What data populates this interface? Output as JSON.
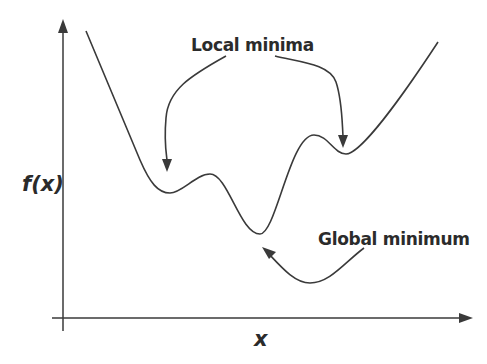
{
  "diagram": {
    "type": "function-landscape",
    "axes": {
      "y_label": "f(x)",
      "x_label": "x"
    },
    "annotations": {
      "local": "Local minima",
      "global": "Global minimum"
    },
    "colors": {
      "line": "#3a3a3a",
      "text": "#2b2b2b",
      "background": "#ffffff"
    },
    "curve_features": [
      {
        "kind": "start",
        "x": 86,
        "y": 31
      },
      {
        "kind": "local-minimum",
        "x": 170,
        "y": 193
      },
      {
        "kind": "local-maximum",
        "x": 210,
        "y": 174
      },
      {
        "kind": "global-minimum",
        "x": 260,
        "y": 234
      },
      {
        "kind": "local-maximum",
        "x": 314,
        "y": 135
      },
      {
        "kind": "local-minimum",
        "x": 346,
        "y": 154
      },
      {
        "kind": "end",
        "x": 438,
        "y": 42
      }
    ]
  }
}
